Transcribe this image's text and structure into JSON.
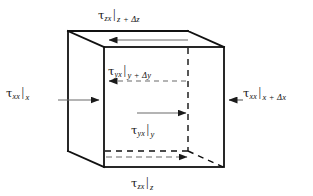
{
  "figure": {
    "colors": {
      "line": "#111111",
      "arrow": "#555555",
      "background": "#ffffff"
    },
    "cube": {
      "front_face": [
        [
          104,
          47
        ],
        [
          224,
          47
        ],
        [
          224,
          167
        ],
        [
          104,
          167
        ]
      ],
      "back_face": [
        [
          68,
          31
        ],
        [
          188,
          31
        ],
        [
          188,
          151
        ],
        [
          68,
          151
        ]
      ],
      "hidden_vertex": [
        188,
        151
      ]
    }
  },
  "labels": {
    "top": {
      "name": "tau-zx-z-plus-dz",
      "symbol": "τ",
      "subscript": "zx",
      "bar": "|",
      "evaluated_at": "z + Δz",
      "full_text": "τzx|z + Δz"
    },
    "bottom": {
      "name": "tau-zx-z",
      "symbol": "τ",
      "subscript": "zx",
      "bar": "|",
      "evaluated_at": "z",
      "full_text": "τzx|z"
    },
    "left": {
      "name": "tau-xx-x",
      "symbol": "τ",
      "subscript": "xx",
      "bar": "|",
      "evaluated_at": "x",
      "full_text": "τxx|x"
    },
    "right": {
      "name": "tau-xx-x-plus-dx",
      "symbol": "τ",
      "subscript": "xx",
      "bar": "|",
      "evaluated_at": "x + Δx",
      "full_text": "τxx|x + Δx"
    },
    "inner_top": {
      "name": "tau-yx-y-plus-dy",
      "symbol": "τ",
      "subscript": "yx",
      "bar": "|",
      "evaluated_at": "y + Δy",
      "full_text": "τyx|y + Δy"
    },
    "inner_bottom": {
      "name": "tau-yx-y",
      "symbol": "τ",
      "subscript": "yx",
      "bar": "|",
      "evaluated_at": "y",
      "full_text": "τyx|y"
    }
  },
  "arrows": [
    {
      "name": "arrow-tau-zx-top",
      "direction": "left",
      "style": "solid",
      "from": [
        188,
        40
      ],
      "to": [
        106,
        40
      ]
    },
    {
      "name": "arrow-tau-zx-bottom",
      "direction": "right",
      "style": "dashed",
      "from": [
        106,
        157
      ],
      "to": [
        190,
        157
      ]
    },
    {
      "name": "arrow-tau-xx-left",
      "direction": "right",
      "style": "solid",
      "from": [
        60,
        100
      ],
      "to": [
        102,
        100
      ]
    },
    {
      "name": "arrow-tau-xx-right",
      "direction": "left",
      "style": "solid",
      "from": [
        240,
        100
      ],
      "to": [
        226,
        100
      ]
    },
    {
      "name": "arrow-tau-yx-upper",
      "direction": "left",
      "style": "dashed",
      "from": [
        186,
        81
      ],
      "to": [
        106,
        81
      ]
    },
    {
      "name": "arrow-tau-yx-lower",
      "direction": "right",
      "style": "solid",
      "from": [
        137,
        113
      ],
      "to": [
        189,
        113
      ]
    }
  ]
}
